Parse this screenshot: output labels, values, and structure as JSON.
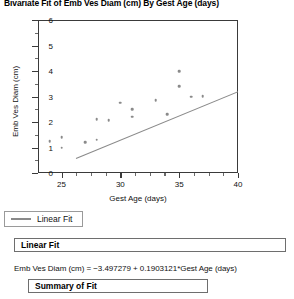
{
  "report": {
    "title": "Bivariate Fit of Emb Ves Diam (cm) By Gest Age (days)",
    "legend": {
      "series_label": "Linear Fit"
    },
    "linear_fit_panel": {
      "header": "Linear Fit",
      "equation": "Emb Ves Diam (cm) = −3.497279 + 0.1903121*Gest Age (days)"
    },
    "summary_panel": {
      "header": "Summary of Fit"
    }
  },
  "chart_data": {
    "type": "scatter",
    "title": "Bivariate Fit of Emb Ves Diam (cm) By Gest Age (days)",
    "xlabel": "Gest Age (days)",
    "ylabel": "Emb Ves Diam (cm)",
    "xlim": [
      23,
      40
    ],
    "ylim": [
      0,
      6
    ],
    "xticks": [
      25,
      30,
      35,
      40
    ],
    "xticks_minor": [
      26.25,
      27.5,
      28.75,
      31.25,
      32.5,
      33.75,
      36.25,
      37.5,
      38.75
    ],
    "yticks": [
      0,
      1,
      2,
      3,
      4,
      5,
      6
    ],
    "yticks_minor": [
      0.5,
      1.5,
      2.5,
      3.5,
      4.5,
      5.5
    ],
    "grid": false,
    "legend_position": "below-axis",
    "marker_color": "#8a8a8a",
    "line_color": "#8a8a8a",
    "series": [
      {
        "name": "Emb Ves Diam (cm)",
        "type": "scatter",
        "points": [
          {
            "x": 24.0,
            "y": 1.25
          },
          {
            "x": 25.0,
            "y": 1.4
          },
          {
            "x": 25.0,
            "y": 1.0
          },
          {
            "x": 27.0,
            "y": 1.2
          },
          {
            "x": 28.0,
            "y": 1.3
          },
          {
            "x": 28.0,
            "y": 2.1
          },
          {
            "x": 29.0,
            "y": 2.08
          },
          {
            "x": 30.0,
            "y": 2.75
          },
          {
            "x": 31.0,
            "y": 2.5
          },
          {
            "x": 31.0,
            "y": 2.2
          },
          {
            "x": 33.0,
            "y": 2.85
          },
          {
            "x": 34.0,
            "y": 2.3
          },
          {
            "x": 35.0,
            "y": 4.0
          },
          {
            "x": 35.0,
            "y": 3.4
          },
          {
            "x": 36.0,
            "y": 3.0
          },
          {
            "x": 37.0,
            "y": 3.02
          }
        ]
      },
      {
        "name": "Linear Fit",
        "type": "line",
        "intercept": -3.497279,
        "slope": 0.1903121,
        "x_range": [
          23,
          40
        ]
      }
    ]
  }
}
